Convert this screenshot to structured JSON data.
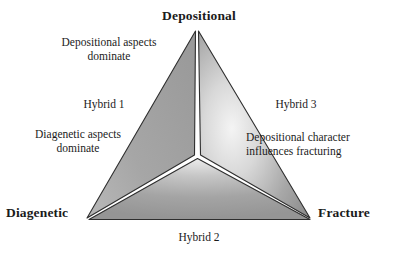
{
  "diagram": {
    "type": "ternary-sector-triangle",
    "vertices": [
      {
        "key": "depositional",
        "label": "Depositional",
        "position": "top"
      },
      {
        "key": "diagenetic",
        "label": "Diagenetic",
        "position": "bottom-left"
      },
      {
        "key": "fracture",
        "label": "Fracture",
        "position": "bottom-right"
      }
    ],
    "edge_labels": [
      {
        "key": "hybrid1",
        "label": "Hybrid 1",
        "edge": "left"
      },
      {
        "key": "hybrid2",
        "label": "Hybrid 2",
        "edge": "bottom"
      },
      {
        "key": "hybrid3",
        "label": "Hybrid 3",
        "edge": "right"
      }
    ],
    "descriptions": [
      {
        "key": "depositional_aspects",
        "label": "Depositional aspects\ndominate"
      },
      {
        "key": "diagenetic_aspects",
        "label": "Diagenetic aspects\ndominate"
      },
      {
        "key": "depositional_character",
        "label": "Depositional character\ninfluences fracturing"
      }
    ],
    "colors": {
      "outline": "#2b2b2b",
      "divider": "#ffffff",
      "sector_left_light": "#c9c9c9",
      "sector_left_dark": "#8d8d8d",
      "sector_right_light": "#f2f2f2",
      "sector_right_dark": "#8a8a8a",
      "sector_bottom_light": "#dedede",
      "sector_bottom_dark": "#8b8b8b",
      "background": "#ffffff",
      "text": "#1b1b1b"
    }
  }
}
